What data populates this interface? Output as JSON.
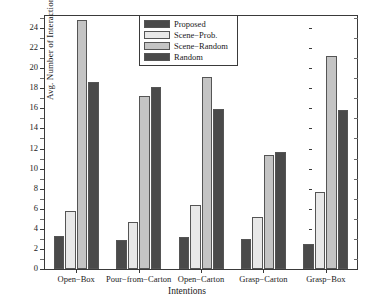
{
  "chart_data": {
    "type": "bar",
    "title": "",
    "xlabel": "Intentions",
    "ylabel": "Avg. Number of Interactions",
    "ylim": [
      0,
      25.2
    ],
    "ytick_labels": [
      "0",
      "2",
      "4",
      "6",
      "8",
      "10",
      "12",
      "14",
      "16",
      "18",
      "20",
      "22",
      "24"
    ],
    "ytick_values": [
      0,
      2,
      4,
      6,
      8,
      10,
      12,
      14,
      16,
      18,
      20,
      22,
      24
    ],
    "grid": false,
    "legend_position": "upper center",
    "categories": [
      "Open−Box",
      "Pour−from−Carton",
      "Open−Carton",
      "Grasp−Carton",
      "Grasp−Box"
    ],
    "series": [
      {
        "name": "Proposed",
        "color": "#4a4a4a",
        "values": [
          3.25,
          2.85,
          3.15,
          3.0,
          2.5
        ]
      },
      {
        "name": "Scene−Prob.",
        "color": "#e8e8e8",
        "values": [
          5.8,
          4.65,
          6.4,
          5.2,
          7.7
        ]
      },
      {
        "name": "Scene−Random",
        "color": "#c4c4c4",
        "values": [
          24.85,
          17.25,
          19.1,
          11.4,
          21.2
        ]
      },
      {
        "name": "Random",
        "color": "#4a4a4a",
        "values": [
          18.6,
          18.15,
          15.95,
          11.65,
          15.8
        ]
      }
    ]
  },
  "colors": {
    "axis": "#3a3a3a",
    "bar_edge": "#555555",
    "background": "#ffffff",
    "text": "#1a1a1a"
  }
}
